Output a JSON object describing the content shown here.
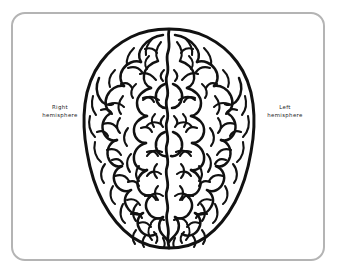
{
  "figure": {
    "kind": "anatomical-illustration",
    "frame_color": "#b4b4b4",
    "background_color": "#ffffff",
    "ink_color": "#111111",
    "label_color": "#1d1d1d"
  },
  "labels": {
    "right_hemisphere": {
      "line1": "Right",
      "line2": "hemisphere"
    },
    "left_hemisphere": {
      "line1": "Left",
      "line2": "hemisphere"
    }
  },
  "illustration": {
    "name": "brain-superior-view",
    "has_midline_fissure": true,
    "midline_label": "longitudinal fissure"
  }
}
